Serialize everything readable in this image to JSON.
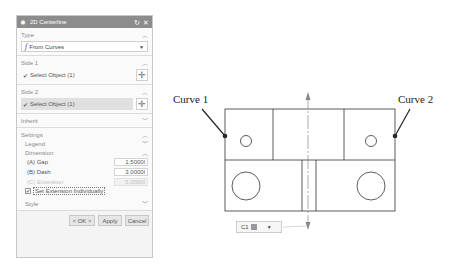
{
  "dialog": {
    "title": "2D Centerline",
    "icons": {
      "gear": "gear-icon",
      "reset": "reset-icon",
      "close": "close-icon"
    },
    "type": {
      "heading": "Type",
      "selected": "From Curves",
      "icon": "curve-function-icon"
    },
    "side1": {
      "heading": "Side 1",
      "select_label": "Select Object (1)"
    },
    "side2": {
      "heading": "Side 2",
      "select_label": "Select Object (1)"
    },
    "inherit": {
      "heading": "Inherit"
    },
    "settings": {
      "heading": "Settings",
      "legend": {
        "heading": "Legend"
      },
      "dimension": {
        "heading": "Dimension",
        "gap": {
          "label": "(A) Gap",
          "value": "1.5000l"
        },
        "dash": {
          "label": "(B) Dash",
          "value": "3.0000l"
        },
        "extension": {
          "label": "(C) Extension",
          "value": "5.0000l"
        },
        "set_individually": {
          "label": "Set Extension Individually",
          "checked": true
        }
      },
      "style": {
        "heading": "Style"
      }
    },
    "buttons": {
      "ok": "< OK >",
      "apply": "Apply",
      "cancel": "Cancel"
    }
  },
  "drawing": {
    "curve1_label": "Curve 1",
    "curve2_label": "Curve 2",
    "handle_label": "C1"
  }
}
